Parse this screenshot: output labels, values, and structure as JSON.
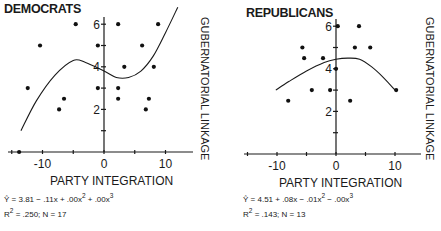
{
  "chart_data": [
    {
      "type": "scatter",
      "title": "DEMOCRATS",
      "xlabel": "PARTY INTEGRATION",
      "ylabel": "GUBERNATORIAL LINKAGE",
      "x_ticks": [
        -10,
        0,
        10
      ],
      "y_ticks": [
        2,
        4,
        6
      ],
      "xlim": [
        -15,
        15
      ],
      "ylim": [
        0,
        6.7
      ],
      "grid": false,
      "points": [
        {
          "x": -13.8,
          "y": 0
        },
        {
          "x": -12.4,
          "y": 3
        },
        {
          "x": -10.4,
          "y": 5
        },
        {
          "x": -7.3,
          "y": 2
        },
        {
          "x": -6.5,
          "y": 2.5
        },
        {
          "x": -4.6,
          "y": 6
        },
        {
          "x": -1,
          "y": 5
        },
        {
          "x": -1,
          "y": 3
        },
        {
          "x": 2.3,
          "y": 6
        },
        {
          "x": 3.3,
          "y": 4
        },
        {
          "x": 2.3,
          "y": 3
        },
        {
          "x": 2.3,
          "y": 2.5
        },
        {
          "x": 6.2,
          "y": 5
        },
        {
          "x": 7.3,
          "y": 2.5
        },
        {
          "x": 6.8,
          "y": 2
        },
        {
          "x": 8.1,
          "y": 4
        },
        {
          "x": 8.8,
          "y": 6
        }
      ],
      "fit_curve": {
        "x": [
          -13.5,
          -11,
          -8,
          -5,
          -3,
          0,
          2,
          4,
          6,
          8,
          10,
          12
        ],
        "y": [
          1.0,
          2.4,
          3.6,
          4.3,
          4.2,
          3.8,
          3.5,
          3.5,
          3.8,
          4.5,
          5.6,
          6.8
        ]
      },
      "equation": "Ŷ = 3.81 − .11x + .00x² + .00x³",
      "equation_parts": {
        "lhs": "Ŷ = 3.81 − .11x + .00x",
        "exp1": "2",
        "mid": " + .00x",
        "exp2": "3"
      },
      "stats": {
        "r2_label": "R",
        "r2_exp": "2",
        "r2_rest": " = .250;  N = 17",
        "r2": 0.25,
        "n": 17
      }
    },
    {
      "type": "scatter",
      "title": "REPUBLICANS",
      "xlabel": "PARTY INTEGRATION",
      "ylabel": "GUBERNATORIAL LINKAGE",
      "x_ticks": [
        -10,
        0,
        10
      ],
      "y_ticks": [
        2,
        4,
        6
      ],
      "xlim": [
        -15,
        15
      ],
      "ylim": [
        0,
        6.7
      ],
      "grid": false,
      "points": [
        {
          "x": -5.7,
          "y": 5
        },
        {
          "x": -5.4,
          "y": 4.5
        },
        {
          "x": -2.2,
          "y": 4.5
        },
        {
          "x": 0.3,
          "y": 6
        },
        {
          "x": 3.9,
          "y": 6
        },
        {
          "x": 3.2,
          "y": 5
        },
        {
          "x": 5.8,
          "y": 5
        },
        {
          "x": 0,
          "y": 4
        },
        {
          "x": -8.1,
          "y": 2.5
        },
        {
          "x": -4.1,
          "y": 3
        },
        {
          "x": -1,
          "y": 3
        },
        {
          "x": 2.4,
          "y": 2.5
        },
        {
          "x": 10.2,
          "y": 3
        }
      ],
      "fit_curve": {
        "x": [
          -10.2,
          -8,
          -5,
          -2,
          0,
          2,
          4,
          6,
          8,
          10
        ],
        "y": [
          3.0,
          3.4,
          3.9,
          4.3,
          4.45,
          4.5,
          4.45,
          4.1,
          3.6,
          3.0
        ]
      },
      "equation": "Ŷ = 4.51 + .08x − .01x² − .00x³",
      "equation_parts": {
        "lhs": "Ŷ = 4.51 + .08x − .01x",
        "exp1": "2",
        "mid": " − .00x",
        "exp2": "3"
      },
      "stats": {
        "r2_label": "R",
        "r2_exp": "2",
        "r2_rest": " = .143;  N = 13",
        "r2": 0.143,
        "n": 13
      }
    }
  ],
  "layout": [
    {
      "origin_x": 104,
      "origin_y": 152,
      "px_per_x": 6.15,
      "px_per_y": 21.3,
      "axis_left": 8,
      "axis_right": 193,
      "axis_top": 17,
      "title_x": 4,
      "title_y": 13,
      "xlabel_x": 50,
      "xlabel_y": 185,
      "ylabel_x": 201,
      "ylabel_y": 17,
      "eq_x": 4,
      "eq_y": 202,
      "stats_y": 216
    },
    {
      "origin_x": 336,
      "origin_y": 154,
      "px_per_x": 5.9,
      "px_per_y": 21.3,
      "axis_left": 244,
      "axis_right": 421,
      "axis_top": 19,
      "title_x": 246,
      "title_y": 17,
      "xlabel_x": 279,
      "xlabel_y": 187,
      "ylabel_x": 426,
      "ylabel_y": 17,
      "eq_x": 243,
      "eq_y": 202,
      "stats_y": 216
    }
  ]
}
